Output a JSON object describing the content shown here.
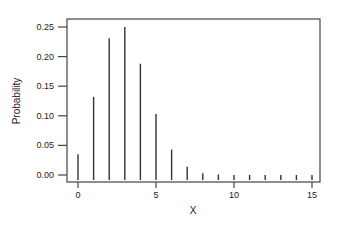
{
  "chart_data": {
    "type": "bar",
    "subtype": "stick / probability mass function",
    "title": "",
    "xlabel": "X",
    "ylabel": "Probability",
    "x": [
      0,
      1,
      2,
      3,
      4,
      5,
      6,
      7,
      8,
      9,
      10,
      11,
      12,
      13,
      14,
      15
    ],
    "values": [
      0.035,
      0.132,
      0.231,
      0.25,
      0.188,
      0.103,
      0.043,
      0.014,
      0.003,
      0.001,
      0.0,
      0.0,
      0.0,
      0.0,
      0.0,
      0.0
    ],
    "xlim": [
      -0.7,
      15.6
    ],
    "ylim": [
      -0.012,
      0.263
    ],
    "x_ticks": [
      0,
      5,
      10,
      15
    ],
    "x_tick_labels": [
      "0",
      "5",
      "10",
      "15"
    ],
    "y_ticks": [
      0.0,
      0.05,
      0.1,
      0.15,
      0.2,
      0.25
    ],
    "y_tick_labels": [
      "0.00",
      "0.05",
      "0.10",
      "0.15",
      "0.20",
      "0.25"
    ],
    "grid": false,
    "legend": null,
    "bar_color": "#333333",
    "frame_color": "#444444"
  }
}
